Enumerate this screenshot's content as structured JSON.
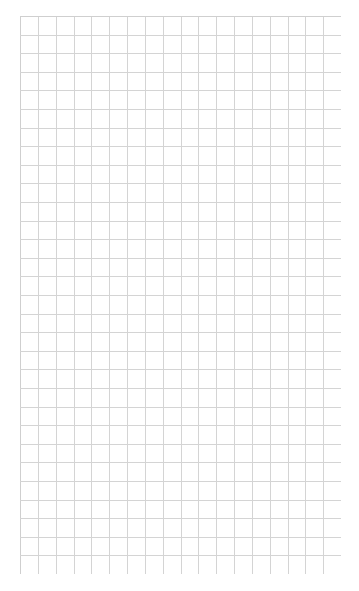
{
  "page": {
    "background": "#ffffff"
  },
  "grid": {
    "columns": 18,
    "rows": 30,
    "line_color": "#d4d4d4",
    "border_color": "#cfcfcf"
  }
}
